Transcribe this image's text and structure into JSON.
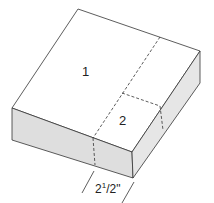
{
  "diagram": {
    "type": "isometric-box",
    "regions": [
      {
        "id": "1",
        "label": "1"
      },
      {
        "id": "2",
        "label": "2"
      }
    ],
    "dimension": {
      "whole": "2",
      "sup": "1",
      "rest": "/2\""
    },
    "colors": {
      "top": "#ffffff",
      "side": "#dedede",
      "line": "#333333"
    }
  }
}
